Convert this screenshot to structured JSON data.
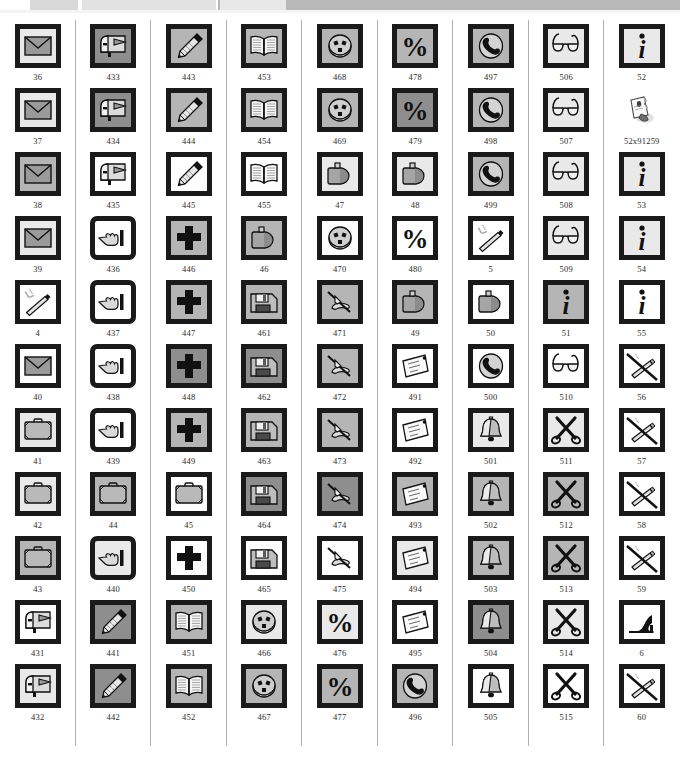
{
  "header": {
    "segments": [
      "",
      "",
      "",
      ""
    ],
    "note": ""
  },
  "palette": {
    "frame_black": "#1a1a1a",
    "tile_light": "#e9e9e9",
    "tile_medium": "#b5b5b5",
    "tile_dark": "#8e8e8e",
    "tile_white": "#ffffff",
    "rule_gray": "#b0b0b0",
    "label_ink": "#2a2a2a",
    "header_gray": "#b9b9b9"
  },
  "grid": {
    "columns": 9,
    "rows": 11,
    "columns_data": [
      {
        "name": "envelope-briefcase-mailbox-column",
        "cells": [
          {
            "label": "36",
            "icon": "envelope-icon",
            "bg": "lt",
            "style": "plain"
          },
          {
            "label": "37",
            "icon": "envelope-icon",
            "bg": "lt",
            "style": "plain"
          },
          {
            "label": "38",
            "icon": "envelope-icon",
            "bg": "md",
            "style": "plain"
          },
          {
            "label": "39",
            "icon": "envelope-icon",
            "bg": "lt",
            "style": "plain"
          },
          {
            "label": "4",
            "icon": "cigarette-icon",
            "bg": "wh",
            "style": "plain"
          },
          {
            "label": "40",
            "icon": "envelope-icon",
            "bg": "wh",
            "style": "plain"
          },
          {
            "label": "41",
            "icon": "briefcase-icon",
            "bg": "lt",
            "style": "plain"
          },
          {
            "label": "42",
            "icon": "briefcase-icon",
            "bg": "lt",
            "style": "plain"
          },
          {
            "label": "43",
            "icon": "briefcase-icon",
            "bg": "md",
            "style": "plain"
          },
          {
            "label": "431",
            "icon": "mailbox-icon",
            "bg": "wh",
            "style": "plain"
          },
          {
            "label": "432",
            "icon": "mailbox-icon",
            "bg": "lt",
            "style": "plain"
          }
        ]
      },
      {
        "name": "mailbox-pointing-hand-column",
        "cells": [
          {
            "label": "433",
            "icon": "mailbox-icon",
            "bg": "dk",
            "style": "plain"
          },
          {
            "label": "434",
            "icon": "mailbox-icon",
            "bg": "dk",
            "style": "plain"
          },
          {
            "label": "435",
            "icon": "mailbox-icon",
            "bg": "wh",
            "style": "plain"
          },
          {
            "label": "436",
            "icon": "pointing-hand-icon",
            "bg": "wh",
            "style": "rounded"
          },
          {
            "label": "437",
            "icon": "pointing-hand-icon",
            "bg": "wh",
            "style": "rounded"
          },
          {
            "label": "438",
            "icon": "pointing-hand-icon",
            "bg": "wh",
            "style": "rounded"
          },
          {
            "label": "439",
            "icon": "pointing-hand-icon",
            "bg": "wh",
            "style": "rounded"
          },
          {
            "label": "44",
            "icon": "briefcase-icon",
            "bg": "md",
            "style": "plain"
          },
          {
            "label": "440",
            "icon": "pointing-hand-icon",
            "bg": "lt",
            "style": "rounded"
          },
          {
            "label": "441",
            "icon": "pencil-icon",
            "bg": "dk",
            "style": "plain"
          },
          {
            "label": "442",
            "icon": "pencil-icon",
            "bg": "dk",
            "style": "plain"
          }
        ]
      },
      {
        "name": "pencil-cross-column",
        "cells": [
          {
            "label": "443",
            "icon": "pencil-icon",
            "bg": "md",
            "style": "plain"
          },
          {
            "label": "444",
            "icon": "pencil-icon",
            "bg": "md",
            "style": "plain"
          },
          {
            "label": "445",
            "icon": "pencil-icon",
            "bg": "wh",
            "style": "plain"
          },
          {
            "label": "446",
            "icon": "cross-icon",
            "bg": "md",
            "style": "plain"
          },
          {
            "label": "447",
            "icon": "cross-icon",
            "bg": "md",
            "style": "plain"
          },
          {
            "label": "448",
            "icon": "cross-icon",
            "bg": "dk",
            "style": "plain"
          },
          {
            "label": "449",
            "icon": "cross-icon",
            "bg": "md",
            "style": "plain"
          },
          {
            "label": "45",
            "icon": "briefcase-icon",
            "bg": "wh",
            "style": "plain"
          },
          {
            "label": "450",
            "icon": "cross-icon",
            "bg": "wh",
            "style": "plain"
          },
          {
            "label": "451",
            "icon": "open-book-icon",
            "bg": "md",
            "style": "plain"
          },
          {
            "label": "452",
            "icon": "open-book-icon",
            "bg": "md",
            "style": "plain"
          }
        ]
      },
      {
        "name": "book-jerrycan-floppy-column",
        "cells": [
          {
            "label": "453",
            "icon": "open-book-icon",
            "bg": "md",
            "style": "plain"
          },
          {
            "label": "454",
            "icon": "open-book-icon",
            "bg": "md",
            "style": "plain"
          },
          {
            "label": "455",
            "icon": "open-book-icon",
            "bg": "wh",
            "style": "plain"
          },
          {
            "label": "46",
            "icon": "jerrycan-icon",
            "bg": "md",
            "style": "plain"
          },
          {
            "label": "461",
            "icon": "floppy-disk-icon",
            "bg": "md",
            "style": "plain"
          },
          {
            "label": "462",
            "icon": "floppy-disk-icon",
            "bg": "dk",
            "style": "plain"
          },
          {
            "label": "463",
            "icon": "floppy-disk-icon",
            "bg": "md",
            "style": "plain"
          },
          {
            "label": "464",
            "icon": "floppy-disk-icon",
            "bg": "dk",
            "style": "plain"
          },
          {
            "label": "465",
            "icon": "floppy-disk-icon",
            "bg": "wh",
            "style": "plain"
          },
          {
            "label": "466",
            "icon": "power-socket-icon",
            "bg": "lt",
            "style": "plain"
          },
          {
            "label": "467",
            "icon": "power-socket-icon",
            "bg": "md",
            "style": "plain"
          }
        ]
      },
      {
        "name": "socket-jerrycan-writing-hand-column",
        "cells": [
          {
            "label": "468",
            "icon": "power-socket-icon",
            "bg": "md",
            "style": "plain"
          },
          {
            "label": "469",
            "icon": "power-socket-icon",
            "bg": "md",
            "style": "plain"
          },
          {
            "label": "47",
            "icon": "jerrycan-icon",
            "bg": "lt",
            "style": "plain"
          },
          {
            "label": "470",
            "icon": "power-socket-icon",
            "bg": "wh",
            "style": "plain"
          },
          {
            "label": "471",
            "icon": "writing-hand-icon",
            "bg": "md",
            "style": "plain"
          },
          {
            "label": "472",
            "icon": "writing-hand-icon",
            "bg": "md",
            "style": "plain"
          },
          {
            "label": "473",
            "icon": "writing-hand-icon",
            "bg": "md",
            "style": "plain"
          },
          {
            "label": "474",
            "icon": "writing-hand-icon",
            "bg": "dk",
            "style": "plain"
          },
          {
            "label": "475",
            "icon": "writing-hand-icon",
            "bg": "wh",
            "style": "plain"
          },
          {
            "label": "476",
            "icon": "percent-icon",
            "bg": "lt",
            "style": "plain"
          },
          {
            "label": "477",
            "icon": "percent-icon",
            "bg": "md",
            "style": "plain"
          }
        ]
      },
      {
        "name": "percent-jerrycan-letter-column",
        "cells": [
          {
            "label": "478",
            "icon": "percent-icon",
            "bg": "md",
            "style": "plain"
          },
          {
            "label": "479",
            "icon": "percent-icon",
            "bg": "dk",
            "style": "plain"
          },
          {
            "label": "48",
            "icon": "jerrycan-icon",
            "bg": "lt",
            "style": "plain"
          },
          {
            "label": "480",
            "icon": "percent-icon",
            "bg": "wh",
            "style": "plain"
          },
          {
            "label": "49",
            "icon": "jerrycan-icon",
            "bg": "md",
            "style": "plain"
          },
          {
            "label": "491",
            "icon": "letter-icon",
            "bg": "wh",
            "style": "plain"
          },
          {
            "label": "492",
            "icon": "letter-icon",
            "bg": "wh",
            "style": "plain"
          },
          {
            "label": "493",
            "icon": "letter-icon",
            "bg": "md",
            "style": "plain"
          },
          {
            "label": "494",
            "icon": "letter-icon",
            "bg": "lt",
            "style": "plain"
          },
          {
            "label": "495",
            "icon": "letter-icon",
            "bg": "wh",
            "style": "plain"
          },
          {
            "label": "496",
            "icon": "telephone-icon",
            "bg": "md",
            "style": "plain"
          }
        ]
      },
      {
        "name": "telephone-bell-column",
        "cells": [
          {
            "label": "497",
            "icon": "telephone-icon",
            "bg": "md",
            "style": "plain"
          },
          {
            "label": "498",
            "icon": "telephone-icon",
            "bg": "md",
            "style": "plain"
          },
          {
            "label": "499",
            "icon": "telephone-icon",
            "bg": "md",
            "style": "plain"
          },
          {
            "label": "5",
            "icon": "cigarette-icon",
            "bg": "wh",
            "style": "plain"
          },
          {
            "label": "50",
            "icon": "jerrycan-icon",
            "bg": "wh",
            "style": "plain"
          },
          {
            "label": "500",
            "icon": "telephone-icon",
            "bg": "wh",
            "style": "plain"
          },
          {
            "label": "501",
            "icon": "bell-icon",
            "bg": "lt",
            "style": "plain"
          },
          {
            "label": "502",
            "icon": "bell-icon",
            "bg": "md",
            "style": "plain"
          },
          {
            "label": "503",
            "icon": "bell-icon",
            "bg": "md",
            "style": "plain"
          },
          {
            "label": "504",
            "icon": "bell-icon",
            "bg": "dk",
            "style": "plain"
          },
          {
            "label": "505",
            "icon": "bell-icon",
            "bg": "wh",
            "style": "plain"
          }
        ]
      },
      {
        "name": "glasses-scissors-column",
        "cells": [
          {
            "label": "506",
            "icon": "glasses-icon",
            "bg": "lt",
            "style": "plain"
          },
          {
            "label": "507",
            "icon": "glasses-icon",
            "bg": "lt",
            "style": "plain"
          },
          {
            "label": "508",
            "icon": "glasses-icon",
            "bg": "lt",
            "style": "plain"
          },
          {
            "label": "509",
            "icon": "glasses-icon",
            "bg": "lt",
            "style": "plain"
          },
          {
            "label": "51",
            "icon": "info-icon",
            "bg": "md",
            "style": "plain"
          },
          {
            "label": "510",
            "icon": "glasses-icon",
            "bg": "wh",
            "style": "plain"
          },
          {
            "label": "511",
            "icon": "scissors-icon",
            "bg": "lt",
            "style": "plain"
          },
          {
            "label": "512",
            "icon": "scissors-icon",
            "bg": "md",
            "style": "plain"
          },
          {
            "label": "513",
            "icon": "scissors-icon",
            "bg": "md",
            "style": "plain"
          },
          {
            "label": "514",
            "icon": "scissors-icon",
            "bg": "lt",
            "style": "plain"
          },
          {
            "label": "515",
            "icon": "scissors-icon",
            "bg": "wh",
            "style": "plain"
          }
        ]
      },
      {
        "name": "info-no-smoking-column",
        "cells": [
          {
            "label": "52",
            "icon": "info-icon",
            "bg": "lt",
            "style": "plain"
          },
          {
            "label": "52x91259",
            "icon": "hand-paper-icon",
            "bg": "wh",
            "style": "noframe"
          },
          {
            "label": "53",
            "icon": "info-icon",
            "bg": "lt",
            "style": "plain"
          },
          {
            "label": "54",
            "icon": "info-icon",
            "bg": "lt",
            "style": "plain"
          },
          {
            "label": "55",
            "icon": "info-icon",
            "bg": "wh",
            "style": "plain"
          },
          {
            "label": "56",
            "icon": "no-smoking-icon",
            "bg": "wh",
            "style": "plain"
          },
          {
            "label": "57",
            "icon": "no-smoking-icon",
            "bg": "wh",
            "style": "plain"
          },
          {
            "label": "58",
            "icon": "no-smoking-icon",
            "bg": "wh",
            "style": "plain"
          },
          {
            "label": "59",
            "icon": "no-smoking-icon",
            "bg": "wh",
            "style": "plain"
          },
          {
            "label": "6",
            "icon": "high-heel-icon",
            "bg": "wh",
            "style": "plain"
          },
          {
            "label": "60",
            "icon": "no-smoking-icon",
            "bg": "wh",
            "style": "plain"
          }
        ]
      }
    ]
  }
}
